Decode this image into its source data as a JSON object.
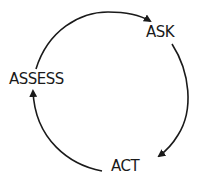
{
  "diagram": {
    "type": "cycle",
    "nodes": [
      {
        "id": "ask",
        "label": "ASK"
      },
      {
        "id": "act",
        "label": "ACT"
      },
      {
        "id": "assess",
        "label": "ASSESS"
      }
    ],
    "edges": [
      {
        "from": "assess",
        "to": "ask"
      },
      {
        "from": "ask",
        "to": "act"
      },
      {
        "from": "act",
        "to": "assess"
      }
    ],
    "colors": {
      "stroke": "#1a1a1a",
      "text": "#1a1a1a",
      "background": "#ffffff"
    }
  }
}
